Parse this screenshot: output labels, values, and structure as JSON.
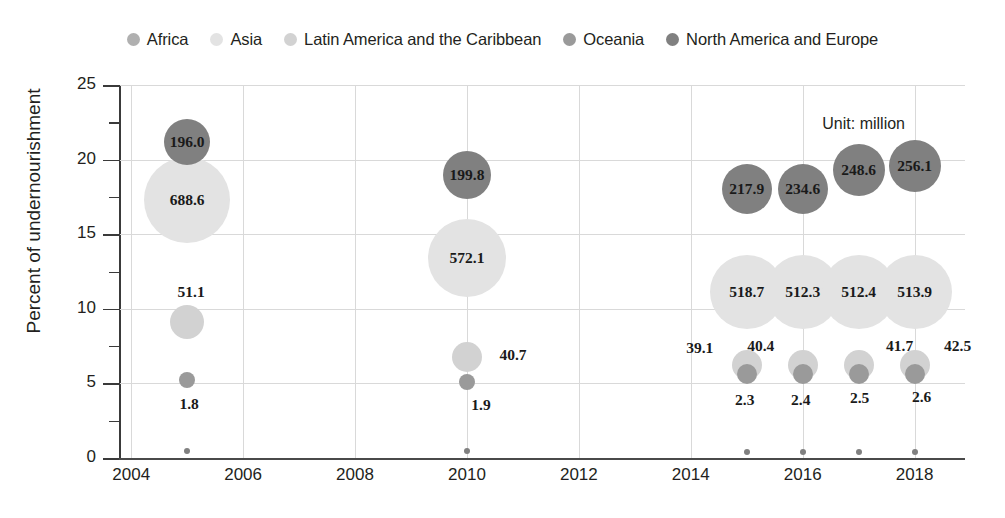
{
  "legend": {
    "items": [
      {
        "label": "Africa",
        "color": "#b0b0b0",
        "key": "africa"
      },
      {
        "label": "Asia",
        "color": "#e3e3e3",
        "key": "asia"
      },
      {
        "label": "Latin America and the Caribbean",
        "color": "#d2d2d2",
        "key": "latam"
      },
      {
        "label": "Oceania",
        "color": "#9a9a9a",
        "key": "oceania"
      },
      {
        "label": "North America and Europe",
        "color": "#808080",
        "key": "name"
      }
    ]
  },
  "annotation": {
    "unit_note": "Unit: million"
  },
  "caption": {
    "text": ""
  },
  "axes": {
    "ylabel": "Percent of undernourishment",
    "ytick_labels": [
      "0",
      "5",
      "10",
      "15",
      "20",
      "25"
    ],
    "xtick_labels": [
      "2004",
      "2006",
      "2008",
      "2010",
      "2012",
      "2014",
      "2016",
      "2018"
    ]
  },
  "chart_data": {
    "type": "scatter",
    "title": "",
    "xlabel": "",
    "ylabel": "Percent of undernourishment",
    "xlim": [
      2003.8,
      2018.9
    ],
    "ylim": [
      0,
      25
    ],
    "xticks": [
      2004,
      2006,
      2008,
      2010,
      2012,
      2014,
      2016,
      2018
    ],
    "yticks": [
      0,
      5,
      10,
      15,
      20,
      25
    ],
    "yticks_minor": [
      2.5,
      7.5,
      12.5,
      17.5,
      22.5
    ],
    "grid": "both-light",
    "legend_position": "top-center",
    "bubble_size_encodes": "number undernourished (million)",
    "unit": "million",
    "series": [
      {
        "name": "Africa",
        "color": "#b0b0b0",
        "points": []
      },
      {
        "name": "Asia",
        "color": "#e3e3e3",
        "points": [
          {
            "x": 2005,
            "y": 17.3,
            "value": 688.6,
            "label": "688.6",
            "r": 43,
            "label_dx": 0,
            "label_dy": 0
          },
          {
            "x": 2010,
            "y": 13.4,
            "value": 572.1,
            "label": "572.1",
            "r": 39,
            "label_dx": 0,
            "label_dy": 0
          },
          {
            "x": 2015,
            "y": 11.1,
            "value": 518.7,
            "label": "518.7",
            "r": 37,
            "label_dx": 0,
            "label_dy": 0
          },
          {
            "x": 2016,
            "y": 11.1,
            "value": 512.3,
            "label": "512.3",
            "r": 37,
            "label_dx": 0,
            "label_dy": 0
          },
          {
            "x": 2017,
            "y": 11.1,
            "value": 512.4,
            "label": "512.4",
            "r": 37,
            "label_dx": 0,
            "label_dy": 0
          },
          {
            "x": 2018,
            "y": 11.1,
            "value": 513.9,
            "label": "513.9",
            "r": 37,
            "label_dx": 0,
            "label_dy": 0
          }
        ]
      },
      {
        "name": "Latin America and the Caribbean",
        "color": "#d2d2d2",
        "points": [
          {
            "x": 2005,
            "y": 9.1,
            "value": 51.1,
            "label": "51.1",
            "r": 17,
            "label_dx": 4,
            "label_dy": -30
          },
          {
            "x": 2010,
            "y": 6.8,
            "value": 40.7,
            "label": "40.7",
            "r": 15,
            "label_dx": 46,
            "label_dy": -2
          },
          {
            "x": 2015,
            "y": 6.2,
            "value": 39.1,
            "label": "39.1",
            "r": 15,
            "label_dx": -47,
            "label_dy": -17
          },
          {
            "x": 2016,
            "y": 6.2,
            "value": 40.4,
            "label": "40.4",
            "r": 15,
            "label_dx": -42,
            "label_dy": -19
          },
          {
            "x": 2017,
            "y": 6.2,
            "value": 41.7,
            "label": "41.7",
            "r": 15,
            "label_dx": 41,
            "label_dy": -19
          },
          {
            "x": 2018,
            "y": 6.2,
            "value": 42.5,
            "label": "42.5",
            "r": 15,
            "label_dx": 43,
            "label_dy": -19
          }
        ]
      },
      {
        "name": "Oceania",
        "color": "#9a9a9a",
        "points": [
          {
            "x": 2005,
            "y": 5.2,
            "value": 1.8,
            "label": "1.8",
            "r": 8,
            "label_dx": 2,
            "label_dy": 24
          },
          {
            "x": 2010,
            "y": 5.1,
            "value": 1.9,
            "label": "1.9",
            "r": 8,
            "label_dx": 14,
            "label_dy": 23
          },
          {
            "x": 2015,
            "y": 5.6,
            "value": 2.3,
            "label": "2.3",
            "r": 10,
            "label_dx": -2,
            "label_dy": 26
          },
          {
            "x": 2016,
            "y": 5.6,
            "value": 2.4,
            "label": "2.4",
            "r": 10,
            "label_dx": -2,
            "label_dy": 26
          },
          {
            "x": 2017,
            "y": 5.6,
            "value": 2.5,
            "label": "2.5",
            "r": 10,
            "label_dx": 1,
            "label_dy": 24
          },
          {
            "x": 2018,
            "y": 5.6,
            "value": 2.6,
            "label": "2.6",
            "r": 10,
            "label_dx": 7,
            "label_dy": 23
          }
        ]
      },
      {
        "name": "North America and Europe",
        "color": "#808080",
        "points": [
          {
            "x": 2005,
            "y": 21.2,
            "value": 196.0,
            "label": "196.0",
            "r": 23,
            "label_dx": 0,
            "label_dy": 0
          },
          {
            "x": 2005,
            "y": 0.5,
            "value": null,
            "label": "",
            "r": 3,
            "label_dx": 0,
            "label_dy": 0
          },
          {
            "x": 2010,
            "y": 19.0,
            "value": 199.8,
            "label": "199.8",
            "r": 24,
            "label_dx": 0,
            "label_dy": 0
          },
          {
            "x": 2010,
            "y": 0.45,
            "value": null,
            "label": "",
            "r": 3,
            "label_dx": 0,
            "label_dy": 0
          },
          {
            "x": 2015,
            "y": 18.0,
            "value": 217.9,
            "label": "217.9",
            "r": 25,
            "label_dx": 0,
            "label_dy": 0
          },
          {
            "x": 2015,
            "y": 0.42,
            "value": null,
            "label": "",
            "r": 3,
            "label_dx": 0,
            "label_dy": 0
          },
          {
            "x": 2016,
            "y": 18.0,
            "value": 234.6,
            "label": "234.6",
            "r": 25,
            "label_dx": 0,
            "label_dy": 0
          },
          {
            "x": 2016,
            "y": 0.42,
            "value": null,
            "label": "",
            "r": 3,
            "label_dx": 0,
            "label_dy": 0
          },
          {
            "x": 2017,
            "y": 19.3,
            "value": 248.6,
            "label": "248.6",
            "r": 26,
            "label_dx": 0,
            "label_dy": 0
          },
          {
            "x": 2017,
            "y": 0.4,
            "value": null,
            "label": "",
            "r": 3,
            "label_dx": 0,
            "label_dy": 0
          },
          {
            "x": 2018,
            "y": 19.6,
            "value": 256.1,
            "label": "256.1",
            "r": 26,
            "label_dx": 0,
            "label_dy": 0
          },
          {
            "x": 2018,
            "y": 0.4,
            "value": null,
            "label": "",
            "r": 3,
            "label_dx": 0,
            "label_dy": 0
          }
        ]
      }
    ]
  }
}
